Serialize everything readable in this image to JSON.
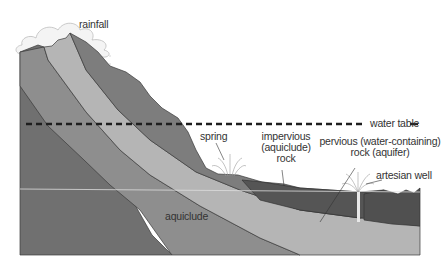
{
  "diagram": {
    "labels": {
      "rainfall": "rainfall",
      "water_table": "water table",
      "spring": "spring",
      "impervious_line1": "impervious",
      "impervious_line2": "(aquiclude)",
      "impervious_line3": "rock",
      "pervious_line1": "pervious (water-containing)",
      "pervious_line2": "rock (aquifer)",
      "artesian_well": "artesian well",
      "aquiclude": "aquiclude"
    },
    "colors": {
      "background": "#ffffff",
      "dark_aquiclude": "#6f6f6f",
      "mid_layer": "#8e8e8e",
      "aquifer": "#b5b5b5",
      "impervious_top": "#7d7d7d",
      "dark_rock_right": "#555555",
      "water_table_line": "#222222",
      "cloud": "#e6e6e6"
    }
  }
}
